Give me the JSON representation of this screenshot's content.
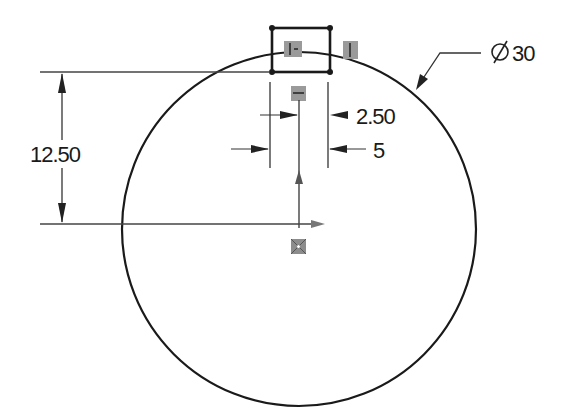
{
  "sketch": {
    "circle_diameter_label": "Ø30",
    "diameter_symbol": "Ø",
    "diameter_value": "30",
    "vertical_dim": "12.50",
    "half_width_dim": "2.50",
    "slot_width_dim": "5"
  },
  "colors": {
    "line": "#1a1a1a",
    "relation_box": "#9a9a9a",
    "dim_line": "#333333"
  }
}
